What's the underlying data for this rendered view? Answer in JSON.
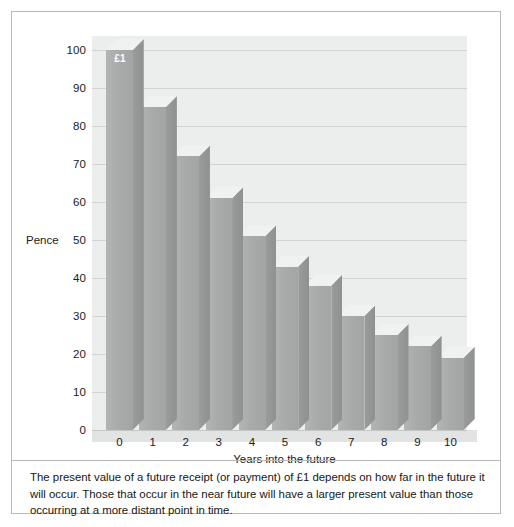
{
  "figure": {
    "caption": "The present value of a future receipt (or payment) of £1 depends on how far in the future it will occur. Those that occur in the near future will have a larger present value than those occurring at a more distant point in time."
  },
  "colors": {
    "plot_background": "#eceded",
    "gridline": "#d2d4d4",
    "bar_front": "#a9abab",
    "bar_side": "#929494",
    "bar_top": "#f0f1f1",
    "frame_border": "#b9b9b9",
    "text": "#1b1b1b",
    "bar_label_text": "#ffffff"
  },
  "chart_data": {
    "type": "bar",
    "title": "",
    "subtitle": "",
    "xlabel": "Years into the future",
    "ylabel": "Pence",
    "categories": [
      "0",
      "1",
      "2",
      "3",
      "4",
      "5",
      "6",
      "7",
      "8",
      "9",
      "10"
    ],
    "values": [
      100,
      85,
      72,
      61,
      51,
      43,
      38,
      30,
      25,
      22,
      19
    ],
    "series": [
      {
        "name": "Present value of £1",
        "values": [
          100,
          85,
          72,
          61,
          51,
          43,
          38,
          30,
          25,
          22,
          19
        ]
      }
    ],
    "ylim": [
      0,
      100
    ],
    "yticks": [
      0,
      10,
      20,
      30,
      40,
      50,
      60,
      70,
      80,
      90,
      100
    ],
    "ytick_labels": [
      "0",
      "10",
      "20",
      "30",
      "40",
      "50",
      "60",
      "70",
      "80",
      "90",
      "100"
    ],
    "xtick_labels": [
      "0",
      "1",
      "2",
      "3",
      "4",
      "5",
      "6",
      "7",
      "8",
      "9",
      "10"
    ],
    "grid": true,
    "grid_axis": "y",
    "legend": false,
    "legend_position": "none",
    "annotations": [
      {
        "text": "£1",
        "target_category": "0",
        "position": "inside-top"
      }
    ],
    "style": "3d-bar",
    "units": "pence"
  }
}
